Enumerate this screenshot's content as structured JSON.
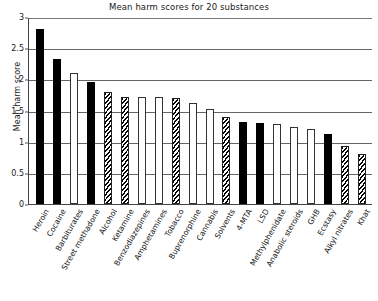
{
  "chart_data": {
    "type": "bar",
    "title": "Mean harm scores for 20 substances",
    "xlabel": "",
    "ylabel": "Mean harm score",
    "ylim": [
      0,
      3
    ],
    "yticks": [
      0,
      0.5,
      1,
      1.5,
      2,
      2.5,
      3
    ],
    "ytick_labels": [
      "0",
      "0.5",
      "1",
      "1.5",
      "2",
      "2.5",
      "3"
    ],
    "grid": true,
    "legend": "none",
    "categories": [
      "Heroin",
      "Cocaine",
      "Barbiturates",
      "Street methadone",
      "Alcohol",
      "Ketamine",
      "Benzodiazepines",
      "Amphetamines",
      "Tobacco",
      "Buprenorphine",
      "Cannabis",
      "Solvents",
      "4-MTA",
      "LSD",
      "Methylphenidate",
      "Anabolic steroids",
      "GHB",
      "Ecstasy",
      "Alkyl nitrates",
      "Khat"
    ],
    "values": [
      2.8,
      2.33,
      2.1,
      1.95,
      1.8,
      1.72,
      1.72,
      1.72,
      1.7,
      1.62,
      1.52,
      1.4,
      1.32,
      1.3,
      1.28,
      1.24,
      1.2,
      1.13,
      0.93,
      0.8
    ],
    "bar_fills": [
      "solid",
      "solid",
      "dotted",
      "solid",
      "hatch",
      "hatch",
      "empty",
      "dotted",
      "hatch",
      "empty",
      "empty",
      "hatch",
      "solid",
      "solid",
      "dotted",
      "empty",
      "empty",
      "solid",
      "hatch",
      "hatch"
    ]
  }
}
